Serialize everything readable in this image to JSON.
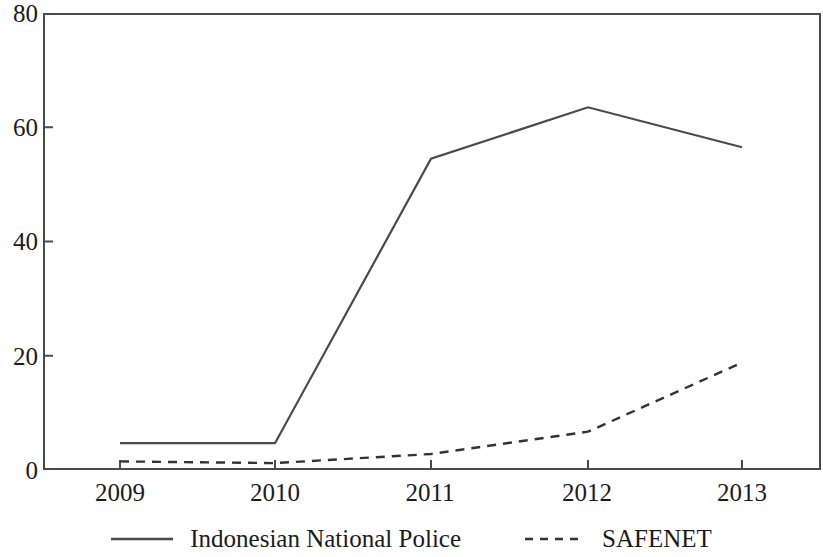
{
  "chart_data": {
    "type": "line",
    "title": "",
    "subtitle": "",
    "xlabel": "",
    "ylabel": "",
    "categories": [
      "2009",
      "2010",
      "2011",
      "2012",
      "2013"
    ],
    "x": [
      2009,
      2010,
      2011,
      2012,
      2013
    ],
    "series": [
      {
        "name": "Indonesian National Police",
        "style": "solid",
        "color": "#4a4a4a",
        "values": [
          4.7,
          4.7,
          54.5,
          63.5,
          56.5
        ]
      },
      {
        "name": "SAFENET",
        "style": "dashed",
        "color": "#333333",
        "values": [
          1.5,
          1.2,
          2.8,
          6.7,
          18.8
        ]
      }
    ],
    "ylim": [
      0,
      80
    ],
    "yticks": [
      0,
      20,
      40,
      60,
      80
    ],
    "ytick_labels": [
      "0",
      "20",
      "40",
      "60",
      "80"
    ],
    "xtick_labels": [
      "2009",
      "2010",
      "2011",
      "2012",
      "2013"
    ],
    "grid": false,
    "legend_position": "bottom",
    "legend": [
      {
        "label": "Indonesian National Police",
        "style": "solid"
      },
      {
        "label": "SAFENET",
        "style": "dashed"
      }
    ]
  },
  "axes": {
    "y": {
      "ticks": [
        {
          "label": "80",
          "value": 80
        },
        {
          "label": "60",
          "value": 60
        },
        {
          "label": "40",
          "value": 40
        },
        {
          "label": "20",
          "value": 20
        },
        {
          "label": "0",
          "value": 0
        }
      ]
    },
    "x": {
      "ticks": [
        {
          "label": "2009",
          "value": 2009
        },
        {
          "label": "2010",
          "value": 2010
        },
        {
          "label": "2011",
          "value": 2011
        },
        {
          "label": "2012",
          "value": 2012
        },
        {
          "label": "2013",
          "value": 2013
        }
      ]
    }
  },
  "legend": {
    "entry1_label": "Indonesian National Police",
    "entry2_label": "SAFENET"
  },
  "colors": {
    "line": "#4a4a4a",
    "axis": "#4a4a4a",
    "text": "#1b1b1b",
    "background": "#ffffff"
  }
}
